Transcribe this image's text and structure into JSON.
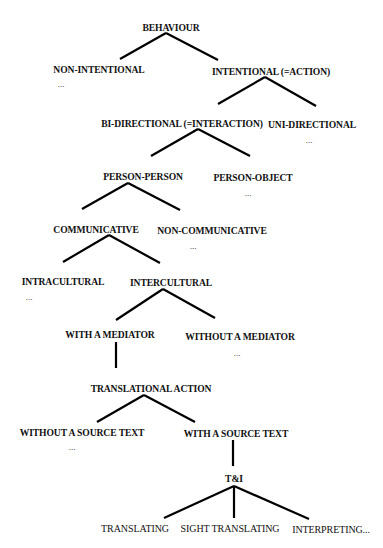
{
  "diagram": {
    "type": "tree",
    "title": "BEHAVIOUR",
    "line_color": "#000000",
    "text_color": "#111111",
    "nodes": [
      {
        "id": "behaviour",
        "label": "BEHAVIOUR",
        "x": 171,
        "y": 27,
        "bold": true
      },
      {
        "id": "non_intentional",
        "label": "NON-INTENTIONAL",
        "x": 99,
        "y": 69,
        "bold": true,
        "ellipsis": "..."
      },
      {
        "id": "intentional",
        "label": "INTENTIONAL (=ACTION)",
        "x": 271,
        "y": 71,
        "bold": true
      },
      {
        "id": "bi_directional",
        "label": "BI-DIRECTIONAL (=INTERACTION)",
        "x": 182,
        "y": 123,
        "bold": true
      },
      {
        "id": "uni_directional",
        "label": "UNI-DIRECTIONAL",
        "x": 312,
        "y": 124,
        "bold": true,
        "ellipsis": "..."
      },
      {
        "id": "person_person",
        "label": "PERSON-PERSON",
        "x": 143,
        "y": 176,
        "bold": true
      },
      {
        "id": "person_object",
        "label": "PERSON-OBJECT",
        "x": 253,
        "y": 177,
        "bold": true,
        "ellipsis": "..."
      },
      {
        "id": "communicative",
        "label": "COMMUNICATIVE",
        "x": 96,
        "y": 229,
        "bold": true
      },
      {
        "id": "non_communicative",
        "label": "NON-COMMUNICATIVE",
        "x": 212,
        "y": 230,
        "bold": true,
        "ellipsis": "..."
      },
      {
        "id": "intracultural",
        "label": "INTRACULTURAL",
        "x": 63,
        "y": 281,
        "bold": true,
        "ellipsis": "..."
      },
      {
        "id": "intercultural",
        "label": "INTERCULTURAL",
        "x": 171,
        "y": 282,
        "bold": true
      },
      {
        "id": "with_mediator",
        "label": "WITH A MEDIATOR",
        "x": 110,
        "y": 334,
        "bold": true
      },
      {
        "id": "without_mediator",
        "label": "WITHOUT A MEDIATOR",
        "x": 240,
        "y": 336,
        "bold": true,
        "ellipsis": "..."
      },
      {
        "id": "translational_action",
        "label": "TRANSLATIONAL ACTION",
        "x": 151,
        "y": 388,
        "bold": true
      },
      {
        "id": "without_source_text",
        "label": "WITHOUT A SOURCE TEXT",
        "x": 82,
        "y": 432,
        "bold": true,
        "ellipsis": "..."
      },
      {
        "id": "with_source_text",
        "label": "WITH A SOURCE TEXT",
        "x": 236,
        "y": 433,
        "bold": true
      },
      {
        "id": "t_and_i",
        "label": "T&I",
        "x": 234,
        "y": 478,
        "bold": true
      },
      {
        "id": "translating",
        "label": "TRANSLATING",
        "x": 135,
        "y": 528,
        "bold": false
      },
      {
        "id": "sight_translating",
        "label": "SIGHT TRANSLATING",
        "x": 230,
        "y": 528,
        "bold": false
      },
      {
        "id": "interpreting",
        "label": "INTERPRETING...",
        "x": 331,
        "y": 529,
        "bold": false
      }
    ],
    "ellipses": [
      {
        "of": "non_intentional",
        "text": "...",
        "x": 61,
        "y": 84
      },
      {
        "of": "uni_directional",
        "text": "...",
        "x": 309,
        "y": 140
      },
      {
        "of": "person_object",
        "text": "...",
        "x": 248,
        "y": 193
      },
      {
        "of": "non_communicative",
        "text": "...",
        "x": 193,
        "y": 246
      },
      {
        "of": "intracultural",
        "text": "...",
        "x": 29,
        "y": 297
      },
      {
        "of": "without_mediator",
        "text": "...",
        "x": 237,
        "y": 353
      },
      {
        "of": "without_source_text",
        "text": "...",
        "x": 72,
        "y": 447
      }
    ],
    "edges": [
      {
        "from": "behaviour",
        "to": "non_intentional",
        "x1": 166,
        "y1": 33,
        "x2": 120,
        "y2": 59
      },
      {
        "from": "behaviour",
        "to": "intentional",
        "x1": 166,
        "y1": 33,
        "x2": 218,
        "y2": 60
      },
      {
        "from": "intentional",
        "to": "bi_directional",
        "x1": 265,
        "y1": 77,
        "x2": 218,
        "y2": 104
      },
      {
        "from": "intentional",
        "to": "uni_directional",
        "x1": 265,
        "y1": 77,
        "x2": 316,
        "y2": 106
      },
      {
        "from": "bi_directional",
        "to": "person_person",
        "x1": 198,
        "y1": 129,
        "x2": 151,
        "y2": 156
      },
      {
        "from": "bi_directional",
        "to": "person_object",
        "x1": 198,
        "y1": 129,
        "x2": 250,
        "y2": 156
      },
      {
        "from": "person_person",
        "to": "communicative",
        "x1": 128,
        "y1": 183,
        "x2": 82,
        "y2": 209
      },
      {
        "from": "person_person",
        "to": "non_communicative",
        "x1": 128,
        "y1": 183,
        "x2": 180,
        "y2": 210
      },
      {
        "from": "communicative",
        "to": "intracultural",
        "x1": 109,
        "y1": 235,
        "x2": 63,
        "y2": 262
      },
      {
        "from": "communicative",
        "to": "intercultural",
        "x1": 109,
        "y1": 235,
        "x2": 160,
        "y2": 263
      },
      {
        "from": "intercultural",
        "to": "with_mediator",
        "x1": 163,
        "y1": 289,
        "x2": 116,
        "y2": 320
      },
      {
        "from": "intercultural",
        "to": "without_mediator",
        "x1": 163,
        "y1": 289,
        "x2": 215,
        "y2": 318
      },
      {
        "from": "with_mediator",
        "to": "translational_action",
        "x1": 116,
        "y1": 342,
        "x2": 116,
        "y2": 368
      },
      {
        "from": "translational_action",
        "to": "without_source_text",
        "x1": 144,
        "y1": 395,
        "x2": 97,
        "y2": 422
      },
      {
        "from": "translational_action",
        "to": "with_source_text",
        "x1": 144,
        "y1": 395,
        "x2": 195,
        "y2": 422
      },
      {
        "from": "with_source_text",
        "to": "t_and_i",
        "x1": 233,
        "y1": 440,
        "x2": 233,
        "y2": 466
      },
      {
        "from": "t_and_i",
        "to": "translating",
        "x1": 234,
        "y1": 486,
        "x2": 164,
        "y2": 518
      },
      {
        "from": "t_and_i",
        "to": "sight_translating",
        "x1": 234,
        "y1": 486,
        "x2": 234,
        "y2": 518
      },
      {
        "from": "t_and_i",
        "to": "interpreting",
        "x1": 234,
        "y1": 486,
        "x2": 309,
        "y2": 519
      }
    ]
  }
}
